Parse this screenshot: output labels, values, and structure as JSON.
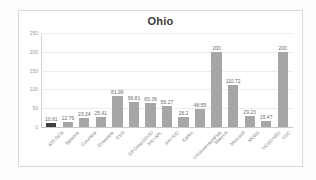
{
  "chart_data": {
    "type": "bar",
    "title": "Ohio",
    "xlabel": "",
    "ylabel": "",
    "ylim": [
      0,
      250
    ],
    "yticks": [
      0,
      50,
      100,
      150,
      200,
      250
    ],
    "ytick_labels": [
      "0",
      "50",
      "100",
      "150",
      "200",
      "250"
    ],
    "grid": true,
    "legend": "none",
    "bar_color": "#a6a6a6",
    "highlight_color": "#3f3f3f",
    "categories": [
      "A3T-GCN",
      "Baseline",
      "Columbia",
      "Ensemble",
      "ESG",
      "GT-DeepCOVID",
      "JHU-APL",
      "JHU-IDD",
      "Karlen",
      "UVolomentumFlub",
      "MaurnA",
      "Microsoft",
      "MOBS",
      "UCSD-NEU",
      "USC"
    ],
    "values": [
      10.81,
      12.79,
      23.24,
      25.41,
      81.96,
      66.81,
      63.39,
      56.27,
      26.2,
      48.55,
      200,
      110.72,
      29.23,
      15.47,
      200
    ],
    "value_labels": [
      "10.81",
      "12.79",
      "23.24",
      "25.41",
      "81.96",
      "66.81",
      "63.39",
      "56.27",
      "26.2",
      "48.55",
      "200",
      "110.72",
      "29.23",
      "15.47",
      "200"
    ]
  }
}
